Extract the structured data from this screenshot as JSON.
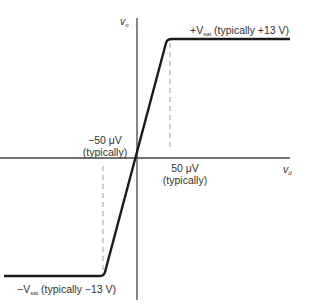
{
  "diagram": {
    "axes": {
      "y_label": "v",
      "y_label_sub": "o",
      "x_label": "v",
      "x_label_sub": "d"
    },
    "annotations": {
      "pos_sat_prefix": "+V",
      "pos_sat_sub": "sat",
      "pos_sat_suffix": " (typically +13 V)",
      "neg_sat_prefix": "−V",
      "neg_sat_sub": "sat",
      "neg_sat_suffix": " (typically −13 V)",
      "neg_threshold_value": "−50 μV",
      "neg_threshold_note": "(typically)",
      "pos_threshold_value": "50 μV",
      "pos_threshold_note": "(typically)"
    },
    "colors": {
      "curve": "#1a1a1a",
      "axes": "#333333",
      "dashed": "#888888"
    }
  }
}
